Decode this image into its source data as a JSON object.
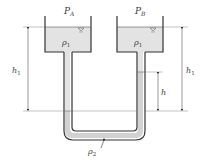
{
  "diagram": {
    "type": "U-tube manometer",
    "labels": {
      "pressure_a": "P",
      "pressure_a_sub": "A",
      "pressure_b": "P",
      "pressure_b_sub": "B",
      "density_left": "ρ",
      "density_left_sub": "1",
      "density_right": "ρ",
      "density_right_sub": "1",
      "density_bottom": "ρ",
      "density_bottom_sub": "2",
      "height_left": "h",
      "height_left_sub": "1",
      "height_right": "h",
      "height_right_sub": "1",
      "height_diff": "h"
    },
    "colors": {
      "stroke": "#333333",
      "fluid1": "#e3e3e3",
      "fluid2": "#d2d2d2",
      "dim_line": "#555555",
      "ref_line": "#999999"
    }
  }
}
